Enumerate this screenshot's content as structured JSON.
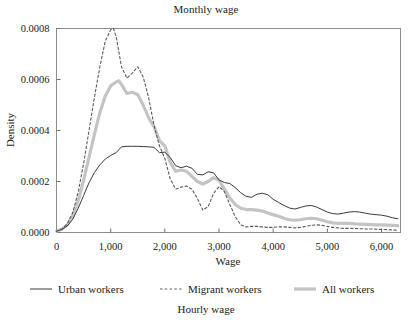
{
  "figure": {
    "title": "Monthly wage",
    "caption": "Hourly wage"
  },
  "colors": {
    "urban": "#3a3a3a",
    "migrant": "#5a5a5a",
    "all": "#c4c4c4",
    "frame": "#8d8d8d",
    "text": "#1a1a1a"
  },
  "axes": {
    "ylabel": "Density",
    "xlabel": "Wage",
    "yticks": [
      "0.0000",
      "0.0002",
      "0.0004",
      "0.0006",
      "0.0008"
    ],
    "ytick_values": [
      0,
      0.0002,
      0.0004,
      0.0006,
      0.0008
    ],
    "xticks": [
      "0",
      "1,000",
      "2,000",
      "3,000",
      "4,000",
      "5,000",
      "6,000"
    ],
    "xtick_values": [
      0,
      1000,
      2000,
      3000,
      4000,
      5000,
      6000
    ],
    "xlim": [
      0,
      6350
    ],
    "ylim": [
      0,
      0.0008
    ],
    "grid": false
  },
  "legend": {
    "position": "below-axes",
    "entries": [
      {
        "label": "Urban workers",
        "style": "solid-thin",
        "color": "#3a3a3a"
      },
      {
        "label": "Migrant workers",
        "style": "dashed",
        "color": "#5a5a5a"
      },
      {
        "label": "All workers",
        "style": "solid-thick",
        "color": "#c4c4c4"
      }
    ]
  },
  "chart_data": {
    "type": "line",
    "title": "Monthly wage",
    "subtitle": "Hourly wage",
    "xlabel": "Wage",
    "ylabel": "Density",
    "xlim": [
      0,
      6350
    ],
    "ylim": [
      0,
      0.0008
    ],
    "grid": false,
    "legend_position": "below-axes",
    "series": [
      {
        "name": "Urban workers",
        "style": "solid-thin",
        "color": "#3a3a3a",
        "x": [
          0,
          100,
          200,
          300,
          400,
          500,
          600,
          700,
          800,
          900,
          1000,
          1100,
          1200,
          1300,
          1400,
          1500,
          1600,
          1700,
          1800,
          1900,
          2000,
          2100,
          2200,
          2300,
          2400,
          2500,
          2600,
          2700,
          2800,
          2900,
          3000,
          3100,
          3200,
          3300,
          3400,
          3500,
          3600,
          3700,
          3800,
          3900,
          4000,
          4100,
          4200,
          4300,
          4400,
          4500,
          4600,
          4700,
          4800,
          4900,
          5000,
          5100,
          5200,
          5300,
          5400,
          5500,
          5600,
          5700,
          5800,
          5900,
          6000,
          6100,
          6200,
          6300
        ],
        "y": [
          5e-06,
          1.2e-05,
          2.6e-05,
          5.2e-05,
          9.5e-05,
          0.000145,
          0.000195,
          0.000235,
          0.000265,
          0.000288,
          0.000302,
          0.000313,
          0.000336,
          0.000338,
          0.000338,
          0.000338,
          0.000337,
          0.000336,
          0.000334,
          0.000313,
          0.000315,
          0.000294,
          0.000262,
          0.000254,
          0.00026,
          0.000252,
          0.000228,
          0.000226,
          0.000238,
          0.000234,
          0.000206,
          0.000196,
          0.000192,
          0.000176,
          0.000156,
          0.000142,
          0.000138,
          0.00015,
          0.000154,
          0.000148,
          0.00013,
          0.000118,
          0.000106,
          9.6e-05,
          9.2e-05,
          9.8e-05,
          0.000104,
          0.000106,
          0.0001,
          9e-05,
          8e-05,
          7.4e-05,
          7.2e-05,
          7.6e-05,
          8e-05,
          8.2e-05,
          8e-05,
          7.6e-05,
          7.2e-05,
          7e-05,
          6.8e-05,
          6.4e-05,
          5.8e-05,
          5.4e-05
        ]
      },
      {
        "name": "Migrant workers",
        "style": "dashed",
        "color": "#5a5a5a",
        "x": [
          0,
          100,
          200,
          300,
          400,
          500,
          600,
          700,
          800,
          900,
          1000,
          1050,
          1100,
          1200,
          1300,
          1400,
          1500,
          1600,
          1700,
          1800,
          1900,
          2000,
          2100,
          2200,
          2300,
          2400,
          2500,
          2600,
          2700,
          2800,
          2900,
          3000,
          3100,
          3200,
          3300,
          3400,
          3500,
          3600,
          3700,
          3800,
          3900,
          4000,
          4100,
          4200,
          4300,
          4400,
          4500,
          4600,
          4700,
          4800,
          4900,
          5000,
          5100,
          5200,
          5300,
          5400,
          5500,
          5600,
          5700,
          5800,
          5900,
          6000,
          6100,
          6200,
          6300
        ],
        "y": [
          5e-06,
          1.4e-05,
          3.4e-05,
          7.8e-05,
          0.000158,
          0.00027,
          0.0004,
          0.00053,
          0.00065,
          0.00075,
          0.000795,
          0.0008,
          0.00077,
          0.00065,
          0.000605,
          0.000625,
          0.00065,
          0.00061,
          0.00053,
          0.00042,
          0.00034,
          0.00029,
          0.00021,
          0.00017,
          0.000178,
          0.000182,
          0.00017,
          0.000134,
          8.8e-05,
          0.000102,
          0.000154,
          0.00018,
          0.00016,
          0.00011,
          6.2e-05,
          3e-05,
          2.2e-05,
          2.4e-05,
          2.4e-05,
          2.2e-05,
          2e-05,
          2e-05,
          2.2e-05,
          2.2e-05,
          2e-05,
          1.8e-05,
          2e-05,
          2.4e-05,
          2.8e-05,
          3e-05,
          2.8e-05,
          2.4e-05,
          2e-05,
          1.8e-05,
          1.6e-05,
          1.6e-05,
          1.6e-05,
          1.5e-05,
          1.4e-05,
          1.4e-05,
          1.3e-05,
          1.2e-05,
          1.1e-05,
          1e-05,
          9e-06
        ]
      },
      {
        "name": "All workers",
        "style": "solid-thick",
        "color": "#c4c4c4",
        "x": [
          0,
          100,
          200,
          300,
          400,
          500,
          600,
          700,
          800,
          900,
          1000,
          1100,
          1150,
          1200,
          1300,
          1400,
          1500,
          1600,
          1700,
          1800,
          1900,
          2000,
          2100,
          2200,
          2300,
          2400,
          2500,
          2600,
          2700,
          2800,
          2900,
          3000,
          3100,
          3200,
          3300,
          3400,
          3500,
          3600,
          3700,
          3800,
          3900,
          4000,
          4100,
          4200,
          4300,
          4400,
          4500,
          4600,
          4700,
          4800,
          4900,
          5000,
          5100,
          5200,
          5300,
          5400,
          5500,
          5600,
          5700,
          5800,
          5900,
          6000,
          6100,
          6200,
          6300
        ],
        "y": [
          5e-06,
          1.3e-05,
          3e-05,
          6.4e-05,
          0.000125,
          0.000205,
          0.000295,
          0.000385,
          0.00047,
          0.000535,
          0.000575,
          0.00059,
          0.000595,
          0.00058,
          0.000545,
          0.00055,
          0.00054,
          0.0005,
          0.00045,
          0.000415,
          0.00036,
          0.00034,
          0.000275,
          0.00024,
          0.000245,
          0.00024,
          0.00022,
          0.0002,
          0.00019,
          0.0002,
          0.000215,
          0.000205,
          0.00017,
          0.000135,
          0.00011,
          9.5e-05,
          9e-05,
          9e-05,
          8.8e-05,
          8.4e-05,
          7.6e-05,
          7e-05,
          6.4e-05,
          5.6e-05,
          5e-05,
          4.8e-05,
          5e-05,
          5.4e-05,
          5.6e-05,
          5.4e-05,
          4.8e-05,
          4.2e-05,
          3.8e-05,
          3.6e-05,
          3.6e-05,
          3.6e-05,
          3.4e-05,
          3.3e-05,
          3.2e-05,
          3.1e-05,
          3e-05,
          3e-05,
          2.9e-05,
          2.8e-05,
          2.7e-05
        ]
      }
    ]
  }
}
